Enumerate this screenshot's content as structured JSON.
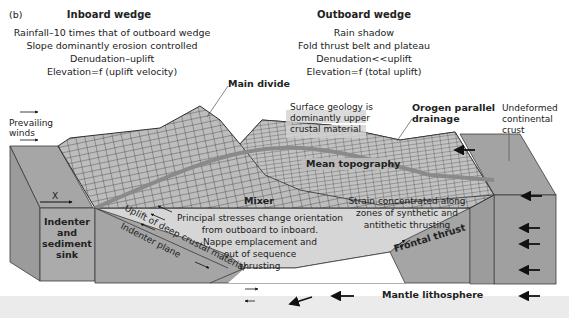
{
  "figure": {
    "panel_label": "(b)",
    "colors": {
      "block_top": "#a3a3a3",
      "block_side": "#9a9a9a",
      "block_front": "#a8a8a8",
      "mixer_fill": "#d4d4d4",
      "topography_fill": "#b8b8b8",
      "mean_topography_band": "#8c8c8c",
      "outline": "#3a3a3a",
      "footer_band": "#ebebeb"
    },
    "inboard": {
      "title": "Inboard wedge",
      "lines": [
        "Rainfall–10 times that of outboard wedge",
        "Slope dominantly erosion controlled",
        "Denudation–uplift",
        "Elevation=f (uplift velocity)"
      ]
    },
    "outboard": {
      "title": "Outboard wedge",
      "lines": [
        "Rain shadow",
        "Fold thrust belt and plateau",
        "Denudation<<uplift",
        "Elevation=f (total uplift)"
      ]
    },
    "labels": {
      "main_divide": "Main divide",
      "prevailing_winds_1": "Prevailing",
      "prevailing_winds_2": "winds",
      "surface_geology_1": "Surface geology is",
      "surface_geology_2": "dominantly upper",
      "surface_geology_3": "crustal material",
      "orogen_parallel_1": "Orogen parallel",
      "orogen_parallel_2": "drainage",
      "undeformed_1": "Undeformed",
      "undeformed_2": "continental",
      "undeformed_3": "crust",
      "mean_topography": "Mean topography",
      "x_marker": "X",
      "mixer": "Mixer",
      "indenter_1": "Indenter",
      "indenter_2": "and",
      "indenter_3": "sediment",
      "indenter_4": "sink",
      "uplift_deep": "Uplift of deep crustal material",
      "indenter_plane": "Indenter plane",
      "principal_1": "Principal stresses change orientation",
      "principal_2": "from outboard to inboard.",
      "principal_3": "Nappe emplacement and",
      "principal_4": "out of sequence",
      "principal_5": "thrusting",
      "strain_1": "Strain concentrated along",
      "strain_2": "zones of synthetic and",
      "strain_3": "antithetic thrusting",
      "frontal_thrust": "Frontal thrust",
      "mantle": "Mantle lithosphere"
    }
  }
}
